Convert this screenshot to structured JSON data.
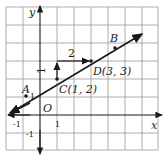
{
  "diagram": {
    "type": "coordinate-plane",
    "axes": {
      "x_label": "x",
      "y_label": "y",
      "origin_label": "O"
    },
    "ticks": {
      "x_neg": "-1",
      "x_pos": "1",
      "y_pos": "1",
      "y_neg": "-1"
    },
    "points": [
      {
        "id": "A",
        "label": "A",
        "x": -1,
        "y": 1
      },
      {
        "id": "C",
        "label": "C(1, 2)",
        "x": 1,
        "y": 2
      },
      {
        "id": "D",
        "label": "D(3, 3)",
        "x": 3,
        "y": 3
      },
      {
        "id": "B",
        "label": "B"
      }
    ],
    "slope_triangle": {
      "rise_label": "1",
      "run_label": "2"
    },
    "colors": {
      "stroke": "#1a1a1a",
      "grid": "#9a9a9a",
      "background": "#ffffff"
    }
  }
}
